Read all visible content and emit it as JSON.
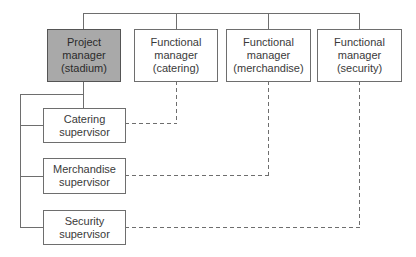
{
  "diagram": {
    "type": "matrix organization chart",
    "managers": [
      {
        "id": "pm",
        "label": "Project\nmanager\n(stadium)",
        "highlighted": true
      },
      {
        "id": "fm-catering",
        "label": "Functional\nmanager\n(catering)",
        "highlighted": false
      },
      {
        "id": "fm-merchandise",
        "label": "Functional\nmanager\n(merchandise)",
        "highlighted": false
      },
      {
        "id": "fm-security",
        "label": "Functional\nmanager\n(security)",
        "highlighted": false
      }
    ],
    "supervisors": [
      {
        "id": "sup-catering",
        "label": "Catering\nsupervisor",
        "reports_to": "pm",
        "dotted_to": "fm-catering"
      },
      {
        "id": "sup-merchandise",
        "label": "Merchandise\nsupervisor",
        "reports_to": "pm",
        "dotted_to": "fm-merchandise"
      },
      {
        "id": "sup-security",
        "label": "Security\nsupervisor",
        "reports_to": "pm",
        "dotted_to": "fm-security"
      }
    ],
    "colors": {
      "highlight_fill": "#a9a9a9",
      "line": "#6e6e6e",
      "text": "#3a3a3a"
    }
  }
}
